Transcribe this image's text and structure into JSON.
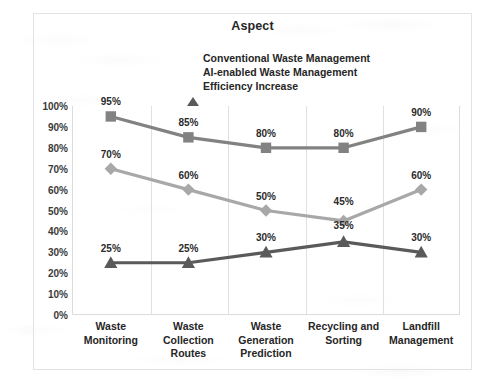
{
  "chart_data": {
    "type": "line",
    "title": "Aspect",
    "xlabel": "",
    "ylabel": "",
    "ylim": [
      0,
      100
    ],
    "ytick_labels": [
      "100%",
      "90%",
      "80%",
      "70%",
      "60%",
      "50%",
      "40%",
      "30%",
      "20%",
      "10%",
      "0%"
    ],
    "ytick_values": [
      100,
      90,
      80,
      70,
      60,
      50,
      40,
      30,
      20,
      10,
      0
    ],
    "grid": "vertical",
    "legend_position": "top-center",
    "categories": [
      "Waste Monitoring",
      "Waste Collection Routes",
      "Waste Generation Prediction",
      "Recycling and Sorting",
      "Landfill Management"
    ],
    "category_lines": [
      [
        "Waste",
        "Monitoring"
      ],
      [
        "Waste",
        "Collection",
        "Routes"
      ],
      [
        "Waste",
        "Generation",
        "Prediction"
      ],
      [
        "Recycling and",
        "Sorting"
      ],
      [
        "Landfill",
        "Management"
      ]
    ],
    "series": [
      {
        "name": "Conventional Waste Management",
        "marker": "diamond",
        "color": "#a8a8a8",
        "values": [
          70,
          60,
          50,
          45,
          60
        ],
        "labels": [
          "70%",
          "60%",
          "50%",
          "45%",
          "60%"
        ]
      },
      {
        "name": "AI-enabled Waste Management",
        "marker": "square",
        "color": "#828282",
        "values": [
          95,
          85,
          80,
          80,
          90
        ],
        "labels": [
          "95%",
          "85%",
          "80%",
          "80%",
          "90%"
        ]
      },
      {
        "name": "Efficiency Increase",
        "marker": "triangle",
        "color": "#5a5a5a",
        "values": [
          25,
          25,
          30,
          35,
          30
        ],
        "labels": [
          "25%",
          "25%",
          "30%",
          "35%",
          "30%"
        ]
      }
    ]
  }
}
